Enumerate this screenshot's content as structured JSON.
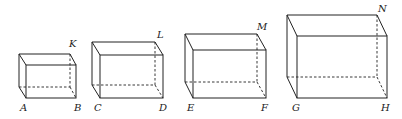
{
  "diagram": {
    "type": "cuboids",
    "boxes": [
      {
        "name": "box-1",
        "labels": {
          "front_bottom_left": "A",
          "front_bottom_right": "B",
          "back_top_right": "K"
        },
        "front": {
          "x1": 26,
          "y1": 65,
          "x2": 76,
          "y2": 98
        },
        "offset": {
          "dx": -7,
          "dy": -11
        }
      },
      {
        "name": "box-2",
        "labels": {
          "front_bottom_left": "C",
          "front_bottom_right": "D",
          "back_top_right": "L"
        },
        "front": {
          "x1": 100,
          "y1": 55,
          "x2": 163,
          "y2": 98
        },
        "offset": {
          "dx": -8,
          "dy": -13
        }
      },
      {
        "name": "box-3",
        "labels": {
          "front_bottom_left": "E",
          "front_bottom_right": "F",
          "back_top_right": "M"
        },
        "front": {
          "x1": 193,
          "y1": 50,
          "x2": 266,
          "y2": 98
        },
        "offset": {
          "dx": -8,
          "dy": -16
        }
      },
      {
        "name": "box-4",
        "labels": {
          "front_bottom_left": "G",
          "front_bottom_right": "H",
          "back_top_right": "N"
        },
        "front": {
          "x1": 297,
          "y1": 36,
          "x2": 387,
          "y2": 98
        },
        "offset": {
          "dx": -10,
          "dy": -21
        }
      }
    ]
  },
  "labels": {
    "A": "A",
    "B": "B",
    "K": "K",
    "C": "C",
    "D": "D",
    "L": "L",
    "E": "E",
    "F": "F",
    "M": "M",
    "G": "G",
    "H": "H",
    "N": "N"
  }
}
